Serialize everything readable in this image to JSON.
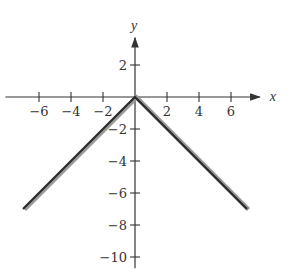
{
  "chart_data": {
    "type": "line",
    "title": "",
    "xlabel": "x",
    "ylabel": "y",
    "xlim": [
      -8.1,
      7.8
    ],
    "ylim": [
      -10.7,
      3.7
    ],
    "grid": false,
    "legend": null,
    "x_ticks": [
      -6,
      -4,
      -2,
      2,
      4,
      6
    ],
    "x_tick_labels": [
      "−6",
      "−4",
      "−2",
      "2",
      "4",
      "6"
    ],
    "y_ticks": [
      2,
      -2,
      -4,
      -6,
      -8,
      -10
    ],
    "y_tick_labels": [
      "2",
      "−2",
      "−4",
      "−6",
      "−8",
      "−10"
    ],
    "series": [
      {
        "name": "y = -|x|",
        "x": [
          -7,
          0,
          7
        ],
        "y": [
          -7,
          0,
          -7
        ],
        "color": "#333333"
      }
    ]
  },
  "layout": {
    "origin_px": [
      135,
      97
    ],
    "px_per_unit": 16,
    "axis_color": "#333333",
    "curve_color": "#2b2b2b",
    "curve_shadow_color": "#9a9a9a"
  }
}
